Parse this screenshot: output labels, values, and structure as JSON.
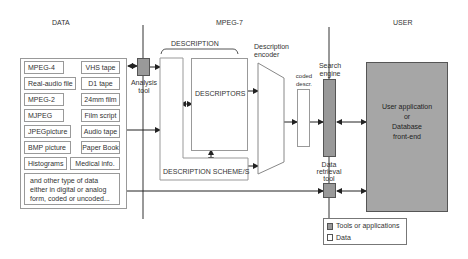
{
  "sections": {
    "data": "DATA",
    "mpeg7": "MPEG-7",
    "user": "USER"
  },
  "data_items": {
    "left": [
      "MPEG-4",
      "Real-audio file",
      "MPEG-2",
      "MJPEG",
      "JPEGpicture",
      "BMP picture",
      "Histograms"
    ],
    "right": [
      "VHS tape",
      "D1 tape",
      "24mm film",
      "Film script",
      "Audio tape",
      "Paper Book",
      "Medical info."
    ],
    "other": [
      "and other type of data",
      "either in digital or analog",
      "form, coded or uncoded..."
    ]
  },
  "analysis_tool": [
    "Analysis",
    "tool"
  ],
  "description": {
    "bracket_label": "DESCRIPTION",
    "descriptors": "DESCRIPTORS",
    "schemes": "DESCRIPTION SCHEME/S"
  },
  "encoder": [
    "Description",
    "encoder"
  ],
  "coded_descr": [
    "coded",
    "descr."
  ],
  "search_engine": [
    "Search",
    "engine"
  ],
  "data_retrieval_tool": [
    "Data",
    "retrieval",
    "tool"
  ],
  "user_app": [
    "User application",
    "or",
    "Database",
    "front-end"
  ],
  "legend": {
    "tools": "Tools or applications",
    "data": "Data"
  },
  "colors": {
    "tool_fill": "#999999",
    "user_app_fill": "#a6a6a6",
    "line": "#333333",
    "box_border": "#999999"
  }
}
